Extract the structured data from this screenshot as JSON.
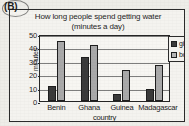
{
  "panel": {
    "label": "(B)"
  },
  "chart_data": {
    "type": "bar",
    "title": "How long people spend getting water",
    "subtitle": "(minutes a day)",
    "xlabel": "country",
    "ylabel": "minutes",
    "categories": [
      "Benin",
      "Ghana",
      "Guinea",
      "Madagascar"
    ],
    "series": [
      {
        "name": "girls",
        "color": "#3a3a3a",
        "values": [
          11.5,
          33,
          5,
          9
        ]
      },
      {
        "name": "boys",
        "color": "#a9a9a9",
        "values": [
          45,
          42,
          23,
          27
        ]
      }
    ],
    "ylim": [
      0,
      50
    ],
    "yticks": [
      0,
      10,
      20,
      30,
      40,
      50
    ],
    "ytick_labels": [
      "0",
      "10",
      "20",
      "30",
      "40",
      "50"
    ],
    "grid": true,
    "legend_position": "right"
  }
}
